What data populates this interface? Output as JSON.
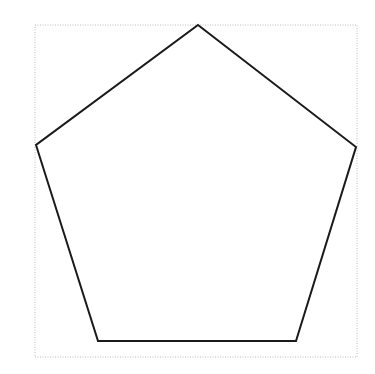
{
  "diagram": {
    "shape": "pentagon",
    "stroke_color": "#1a1a1a",
    "stroke_width": 2,
    "fill_color": "#ffffff",
    "vertices": [
      {
        "x": 198,
        "y": 25
      },
      {
        "x": 356,
        "y": 147
      },
      {
        "x": 296,
        "y": 341
      },
      {
        "x": 98,
        "y": 341
      },
      {
        "x": 36,
        "y": 145
      }
    ],
    "bounding_box": {
      "x": 35,
      "y": 25,
      "width": 322,
      "height": 332,
      "stroke_color": "#bdbdbd",
      "style": "dotted"
    }
  }
}
